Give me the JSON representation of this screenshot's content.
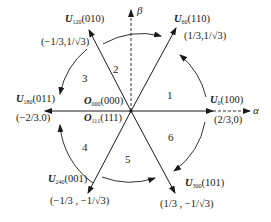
{
  "axes": {
    "alpha": "α",
    "beta": "β"
  },
  "vectors": [
    {
      "name": "U",
      "sub": "0",
      "state": "(100)",
      "coord": "(2/3,0)"
    },
    {
      "name": "U",
      "sub": "60",
      "state": "(110)",
      "coord": "(1/3,1/√3)"
    },
    {
      "name": "U",
      "sub": "120",
      "state": "(010)",
      "coord": "(−1/3,1/√3)"
    },
    {
      "name": "U",
      "sub": "180",
      "state": "(011)",
      "coord": "(−2/3.0)"
    },
    {
      "name": "U",
      "sub": "240",
      "state": "(001)",
      "coord": "(−1/3 , −1/√3)"
    },
    {
      "name": "U",
      "sub": "300",
      "state": "(101)",
      "coord": "(1/3 , −1/√3)"
    }
  ],
  "zero_vectors": [
    {
      "name": "O",
      "sub": "000",
      "state": "(000)"
    },
    {
      "name": "O",
      "sub": "111",
      "state": "(111)"
    }
  ],
  "sectors": [
    "1",
    "2",
    "3",
    "4",
    "5",
    "6"
  ],
  "colors": {
    "line": "#1a1a1a",
    "background": "#ffffff"
  }
}
